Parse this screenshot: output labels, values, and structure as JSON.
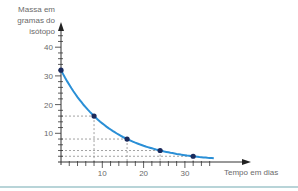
{
  "chart_data": {
    "type": "line",
    "title": "",
    "xlabel": "Tempo em dias",
    "ylabel": "Massa em gramas do isótopo",
    "ylabel_lines": [
      "Massa em",
      "gramas do",
      "isótopo"
    ],
    "x": [
      0,
      8,
      16,
      24,
      32
    ],
    "values": [
      32,
      16,
      8,
      4,
      2
    ],
    "series": [
      {
        "name": "Massa do isótopo (decaimento)",
        "x": [
          0,
          8,
          16,
          24,
          32
        ],
        "values": [
          32,
          16,
          8,
          4,
          2
        ],
        "color": "#2a8fd6"
      }
    ],
    "x_ticks": [
      10,
      20,
      30
    ],
    "y_ticks": [
      10,
      20,
      30,
      40
    ],
    "xlim": [
      0,
      46
    ],
    "ylim": [
      0,
      45
    ],
    "grid": false,
    "guide_lines": "dashed projections from each marked point to both axes",
    "legend": "none"
  },
  "colors": {
    "curve": "#2a8fd6",
    "points": "#1a2a5c",
    "axis": "#333333",
    "text": "#6a6a6a",
    "guides": "#8a8a8a",
    "bottom_rule": "#b8d4d8"
  }
}
